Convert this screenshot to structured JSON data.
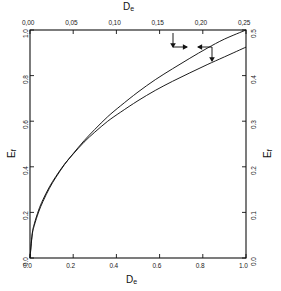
{
  "figure": {
    "background_color": "#ffffff",
    "line_color": "#111111"
  },
  "axes": {
    "top": {
      "title": "D",
      "title_sub": "e",
      "ticks": [
        "0,00",
        "0,05",
        "0,10",
        "0,15",
        "0,20",
        "0,25"
      ],
      "range": [
        0.0,
        0.25
      ]
    },
    "bottom": {
      "title": "D",
      "title_sub": "e",
      "ticks": [
        "0.0",
        "0.2",
        "0.4",
        "0.6",
        "0.8",
        "1.0"
      ],
      "range": [
        0.0,
        1.0
      ]
    },
    "left": {
      "title": "E",
      "title_sub": "f",
      "ticks": [
        "0.0",
        "0.2",
        "0.4",
        "0.6",
        "0.8",
        "1.0"
      ],
      "range": [
        0.0,
        1.0
      ]
    },
    "right": {
      "title": "E",
      "title_sub": "f",
      "ticks": [
        "0.0",
        "0.1",
        "0.2",
        "0.3",
        "0.4",
        "0.5"
      ],
      "range": [
        0.0,
        0.5
      ]
    }
  },
  "chart_data": {
    "type": "line",
    "title": "",
    "xlabel": "D_e",
    "ylabel": "E_f",
    "grid": false,
    "legend": "none",
    "xlim": [
      0.0,
      1.0
    ],
    "ylim": [
      0.0,
      1.0
    ],
    "secondary_xlim": [
      0.0,
      0.25
    ],
    "secondary_ylim": [
      0.0,
      0.5
    ],
    "series": [
      {
        "name": "curve-upper-left-axes",
        "axes": "bottom-left",
        "arrow_direction": "left",
        "x": [
          0.0,
          0.01,
          0.02,
          0.04,
          0.06,
          0.09,
          0.12,
          0.16,
          0.2,
          0.25,
          0.3,
          0.36,
          0.42,
          0.5,
          0.58,
          0.66,
          0.74,
          0.82,
          0.9,
          1.0
        ],
        "y": [
          0.0,
          0.105,
          0.15,
          0.21,
          0.256,
          0.312,
          0.358,
          0.412,
          0.456,
          0.508,
          0.552,
          0.6,
          0.64,
          0.69,
          0.735,
          0.775,
          0.812,
          0.848,
          0.882,
          0.925
        ]
      },
      {
        "name": "curve-lower-right-axes",
        "axes": "top-right",
        "arrow_direction": "right",
        "x": [
          0.0,
          0.01,
          0.02,
          0.04,
          0.06,
          0.09,
          0.12,
          0.16,
          0.2,
          0.25,
          0.3,
          0.36,
          0.42,
          0.5,
          0.58,
          0.66,
          0.74,
          0.82,
          0.9,
          1.0
        ],
        "y": [
          0.0,
          0.1,
          0.143,
          0.202,
          0.248,
          0.306,
          0.354,
          0.41,
          0.458,
          0.514,
          0.564,
          0.62,
          0.668,
          0.728,
          0.782,
          0.83,
          0.876,
          0.92,
          0.96,
          1.0
        ]
      }
    ],
    "annotations": [
      {
        "name": "arrow-to-right-axis",
        "description": "arrow pointing right/down toward lower curve reading on right axis"
      },
      {
        "name": "arrow-to-left-axis",
        "description": "arrow pointing left/down toward upper curve reading on left axis"
      }
    ]
  }
}
